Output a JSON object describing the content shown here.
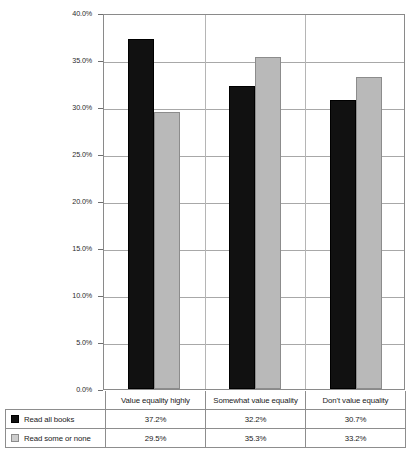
{
  "chart_data": {
    "type": "bar",
    "title": "",
    "xlabel": "",
    "ylabel": "",
    "categories": [
      "Value equality highly",
      "Somewhat value equality",
      "Don't value equality"
    ],
    "series": [
      {
        "name": "Read all books",
        "values": [
          37.2,
          32.2,
          30.7
        ],
        "color": "#111111"
      },
      {
        "name": "Read some or none",
        "values": [
          29.5,
          35.3,
          33.2
        ],
        "color": "#b9b9b9"
      }
    ],
    "value_labels": [
      [
        "37.2%",
        "32.2%",
        "30.7%"
      ],
      [
        "29.5%",
        "35.3%",
        "33.2%"
      ]
    ],
    "ylim": [
      0,
      40
    ],
    "ytick_values": [
      0,
      5,
      10,
      15,
      20,
      25,
      30,
      35,
      40
    ],
    "ytick_labels": [
      "0.0%",
      "5.0%",
      "10.0%",
      "15.0%",
      "20.0%",
      "25.0%",
      "30.0%",
      "35.0%",
      "40.0%"
    ],
    "grid": true,
    "legend_position": "bottom-table",
    "unit": "%"
  },
  "table": {
    "corner_label": "",
    "column_headers": [
      "Value equality highly",
      "Somewhat value equality",
      "Don't value equality"
    ],
    "rows": [
      {
        "label": "Read all books",
        "swatch": "black-square-icon",
        "values": [
          "37.2%",
          "32.2%",
          "30.7%"
        ]
      },
      {
        "label": "Read some or none",
        "swatch": "gray-square-icon",
        "values": [
          "29.5%",
          "35.3%",
          "33.2%"
        ]
      }
    ]
  }
}
